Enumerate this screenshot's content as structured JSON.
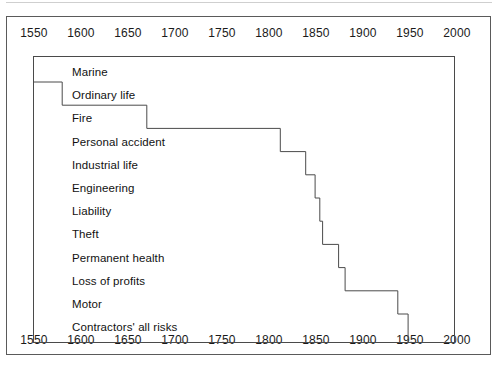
{
  "figure": {
    "background_color": "#ffffff",
    "line_color": "#4a4a4a",
    "text_color": "#111111"
  },
  "axis": {
    "label": "Year",
    "min": 1550,
    "max": 2000,
    "tick_labels": [
      "1550",
      "1600",
      "1650",
      "1700",
      "1750",
      "1800",
      "1850",
      "1900",
      "1950",
      "2000"
    ],
    "tick_values": [
      1550,
      1600,
      1650,
      1700,
      1750,
      1800,
      1850,
      1900,
      1950,
      2000
    ],
    "position_top": true,
    "position_bottom": true
  },
  "chart_data": {
    "type": "bar",
    "subtitle": "",
    "xlabel": "Year",
    "ylabel": "",
    "xlim": [
      1550,
      2000
    ],
    "grid": false,
    "legend": "none",
    "orientation": "horizontal",
    "note": "Step / staircase chart: each class of insurance runs from its year of introduction to the present (right edge of plot, approx. 1990).",
    "plot_right_year": 1990,
    "categories": [
      "Marine",
      "Ordinary life",
      "Fire",
      "Personal accident",
      "Industrial life",
      "Engineering",
      "Liability",
      "Theft",
      "Permanent health",
      "Loss of profits",
      "Motor",
      "Contractors' all risks"
    ],
    "values": [
      1550,
      1580,
      1670,
      1812,
      1839,
      1849,
      1854,
      1857,
      1874,
      1881,
      1937,
      1948
    ],
    "series": [
      {
        "name": "Year of introduction",
        "values": [
          1550,
          1580,
          1670,
          1812,
          1839,
          1849,
          1854,
          1857,
          1874,
          1881,
          1937,
          1948
        ]
      }
    ],
    "points": [
      {
        "label": "Marine",
        "start_year": 1550
      },
      {
        "label": "Ordinary life",
        "start_year": 1580
      },
      {
        "label": "Fire",
        "start_year": 1670
      },
      {
        "label": "Personal accident",
        "start_year": 1812
      },
      {
        "label": "Industrial life",
        "start_year": 1839
      },
      {
        "label": "Engineering",
        "start_year": 1849
      },
      {
        "label": "Liability",
        "start_year": 1854
      },
      {
        "label": "Theft",
        "start_year": 1857
      },
      {
        "label": "Permanent health",
        "start_year": 1874
      },
      {
        "label": "Loss of profits",
        "start_year": 1881
      },
      {
        "label": "Motor",
        "start_year": 1937
      },
      {
        "label": "Contractors' all risks",
        "start_year": 1948
      }
    ]
  }
}
